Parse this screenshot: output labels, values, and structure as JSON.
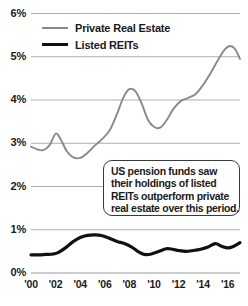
{
  "chart_data": {
    "type": "line",
    "title": "",
    "xlabel": "",
    "ylabel": "",
    "xlim": [
      2000,
      2017
    ],
    "ylim": [
      0,
      6
    ],
    "grid": true,
    "y_unit": "percent",
    "y_ticks": [
      "0%",
      "1%",
      "2%",
      "3%",
      "4%",
      "5%",
      "6%"
    ],
    "y_tick_values": [
      0,
      1,
      2,
      3,
      4,
      5,
      6
    ],
    "x_ticks": [
      "'00",
      "'02",
      "'04",
      "'06",
      "'08",
      "'10",
      "'12",
      "'14",
      "'16"
    ],
    "x_tick_values": [
      2000,
      2002,
      2004,
      2006,
      2008,
      2010,
      2012,
      2014,
      2016
    ],
    "legend_position": "top-left",
    "series": [
      {
        "name": "Private Real Estate",
        "color": "#8a8a8a",
        "width": 1.9,
        "x": [
          2000,
          2000.5,
          2001,
          2001.5,
          2002,
          2002.4,
          2002.9,
          2003.4,
          2004,
          2004.6,
          2005.2,
          2005.8,
          2006.4,
          2007,
          2007.5,
          2008,
          2008.5,
          2009,
          2009.5,
          2010,
          2010.5,
          2011,
          2011.6,
          2012.2,
          2012.8,
          2013.4,
          2014,
          2014.6,
          2015.2,
          2015.8,
          2016.2,
          2016.6,
          2017
        ],
        "values": [
          2.92,
          2.86,
          2.84,
          2.95,
          3.22,
          3.1,
          2.82,
          2.68,
          2.66,
          2.78,
          2.95,
          3.1,
          3.3,
          3.68,
          4.05,
          4.25,
          4.2,
          3.92,
          3.55,
          3.38,
          3.36,
          3.52,
          3.8,
          3.98,
          4.05,
          4.14,
          4.35,
          4.62,
          4.92,
          5.18,
          5.25,
          5.18,
          4.95
        ]
      },
      {
        "name": "Listed REITs",
        "color": "#111111",
        "width": 3.2,
        "x": [
          2000,
          2000.6,
          2001.2,
          2001.8,
          2002.2,
          2002.8,
          2003.4,
          2004,
          2004.6,
          2005.2,
          2005.8,
          2006.4,
          2007,
          2007.6,
          2008.2,
          2008.8,
          2009.2,
          2009.8,
          2010.4,
          2011,
          2011.5,
          2012,
          2012.6,
          2013.2,
          2013.8,
          2014.4,
          2015,
          2015.5,
          2016,
          2016.5,
          2017
        ],
        "values": [
          0.42,
          0.42,
          0.43,
          0.44,
          0.47,
          0.58,
          0.72,
          0.82,
          0.87,
          0.88,
          0.86,
          0.8,
          0.73,
          0.68,
          0.6,
          0.48,
          0.43,
          0.44,
          0.5,
          0.56,
          0.55,
          0.52,
          0.5,
          0.52,
          0.55,
          0.6,
          0.68,
          0.62,
          0.58,
          0.62,
          0.7
        ]
      }
    ],
    "annotations": [
      {
        "name": "callout",
        "lines": [
          "US pension funds saw",
          "their holdings of listed",
          "REITs outperform private",
          "real estate over this period."
        ]
      }
    ]
  },
  "legend": {
    "items": [
      {
        "label": "Private Real Estate",
        "swatch": "private"
      },
      {
        "label": "Listed REITs",
        "swatch": "reits"
      }
    ]
  },
  "colors": {
    "private": "#8a8a8a",
    "reits": "#111111",
    "gridline": "#9a9a9a",
    "text": "#1a1a1a",
    "background": "#ffffff"
  }
}
